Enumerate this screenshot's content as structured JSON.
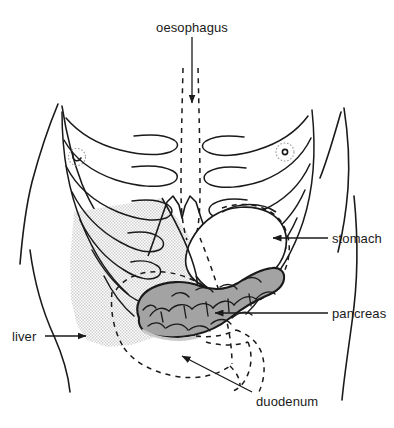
{
  "figure": {
    "background_color": "#ffffff",
    "ink_color": "#1a1a1a",
    "liver_fill": "#dedede",
    "pancreas_fill": "#a3a3a3"
  },
  "labels": {
    "oesophagus": "oesophagus",
    "stomach": "stomach",
    "pancreas": "pancreas",
    "liver": "liver",
    "duodenum": "duodenum"
  },
  "structures": {
    "torso": "body-outline",
    "ribcage_left": "left-rib-cage",
    "ribcage_right": "right-rib-cage",
    "sternum": "sternum-xiphoid",
    "nipple_left": "left-nipple-marker",
    "nipple_right": "right-nipple-marker",
    "oesophagus_shape": "oesophagus-dashed-tube",
    "stomach_shape": "stomach-outline",
    "liver_shape": "liver-shaded-region",
    "pancreas_shape": "pancreas-lobulated-organ",
    "duodenum_shape": "duodenum-dashed-loop"
  }
}
